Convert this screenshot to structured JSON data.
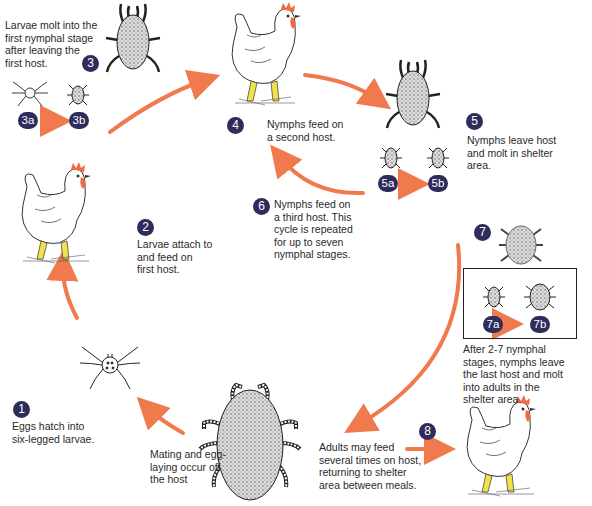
{
  "diagram": {
    "colors": {
      "arrow": "#f07a4e",
      "badge": "#2e2c5a",
      "comb": "#f26a45",
      "legs": "#f1e14a"
    },
    "stages": [
      {
        "id": "1",
        "badge": "1",
        "text_lines": [
          "Eggs hatch into",
          "six-legged larvae."
        ]
      },
      {
        "id": "2",
        "badge": "2",
        "text_lines": [
          "Larvae attach to",
          "and feed on",
          "first host."
        ]
      },
      {
        "id": "3",
        "badge": "3",
        "text_lines": [
          "Larvae molt into the",
          "first nymphal stage",
          "after leaving the",
          "first host."
        ],
        "sub": [
          {
            "badge": "3a"
          },
          {
            "badge": "3b"
          }
        ]
      },
      {
        "id": "4",
        "badge": "4",
        "text_lines": [
          "Nymphs feed on",
          "a second host."
        ]
      },
      {
        "id": "5",
        "badge": "5",
        "text_lines": [
          "Nymphs leave host",
          "and molt in shelter",
          "area."
        ],
        "sub": [
          {
            "badge": "5a"
          },
          {
            "badge": "5b"
          }
        ]
      },
      {
        "id": "6",
        "badge": "6",
        "text_lines": [
          "Nymphs feed on",
          "a third host. This",
          "cycle is repeated",
          "for up to seven",
          "nymphal stages."
        ]
      },
      {
        "id": "7",
        "badge": "7",
        "text_lines": [
          "After 2-7 nymphal",
          "stages, nymphs leave",
          "the last host and molt",
          "into adults in the",
          "shelter area."
        ],
        "sub": [
          {
            "badge": "7a"
          },
          {
            "badge": "7b"
          }
        ]
      },
      {
        "id": "8",
        "badge": "8",
        "text_lines": [
          "Adults may feed",
          "several times on host,",
          "returning to shelter",
          "area between meals."
        ]
      },
      {
        "id": "mating",
        "badge": null,
        "text_lines": [
          "Mating and egg-",
          "laying occur off",
          "the host"
        ]
      }
    ],
    "icons": {
      "hosts": [
        "chicken-icon-first-host",
        "chicken-icon-second-host",
        "chicken-icon-adult-host"
      ],
      "ticks": [
        "larva-icon",
        "nymph-icon",
        "adult-tick-icon"
      ]
    }
  }
}
